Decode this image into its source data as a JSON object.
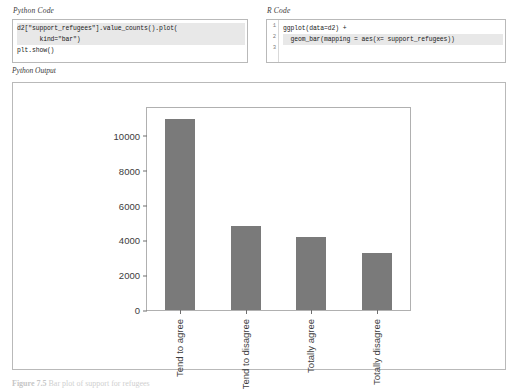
{
  "python_panel": {
    "label": "Python Code",
    "lines": [
      {
        "num": "1",
        "text": "d2[\"support_refugees\"].value_counts().plot(",
        "highlight": true
      },
      {
        "num": "2",
        "text": "      kind=\"bar\")",
        "highlight": true
      },
      {
        "num": "3",
        "text": "plt.show()",
        "highlight": false
      }
    ]
  },
  "r_panel": {
    "label": "R Code",
    "lines": [
      {
        "num": "1",
        "text": "ggplot(data=d2) +",
        "highlight": false
      },
      {
        "num": "2",
        "text": "  geom_bar(mapping = aes(x= support_refugees))",
        "highlight": true
      },
      {
        "num": "3",
        "text": "",
        "highlight": false
      }
    ]
  },
  "output": {
    "label": "Python Output"
  },
  "caption": {
    "number": "Figure 7.5",
    "text": "Bar plot of support for refugees"
  },
  "chart_data": {
    "type": "bar",
    "title": "",
    "xlabel": "",
    "ylabel": "",
    "categories": [
      "Tend to agree",
      "Tend to disagree",
      "Totally agree",
      "Totally disagree"
    ],
    "values": [
      10950,
      4800,
      4200,
      3300
    ],
    "yticks": [
      0,
      2000,
      4000,
      6000,
      8000,
      10000
    ],
    "ytick_labels": [
      "0",
      "2000",
      "4000",
      "6000",
      "8000",
      "10000"
    ],
    "ylim": [
      0,
      11600
    ],
    "grid": false,
    "legend": false,
    "bar_color": "#7a7a7a",
    "axis_color": "#b0b0b0"
  }
}
